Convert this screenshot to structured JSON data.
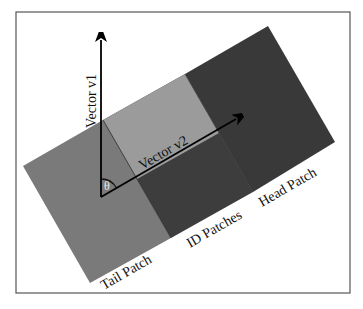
{
  "figure": {
    "frame": {
      "x": 16,
      "y": 12,
      "width": 334,
      "height": 281,
      "stroke": "#555555"
    },
    "colors": {
      "tail_patch": "#7a7a7a",
      "id_patch_light": "#9a9a9a",
      "id_patch_dark": "#3c3c3c",
      "head_patch": "#3a3a3a",
      "vectors": "#000000",
      "text": "#111111"
    },
    "patches": {
      "tail": {
        "label": "Tail Patch",
        "points": "23,166 103,120 171,238 90,283"
      },
      "id_dark": {
        "label": "ID Patches",
        "points": "103,120 185,74 253,192 171,238"
      },
      "id_light": {
        "points": "103,120 185,74 219,133 137,179"
      },
      "head": {
        "label": "Head Patch",
        "points": "185,74 268,26 335,142 253,192"
      }
    },
    "vectors": {
      "v1": {
        "label": "Vector v1",
        "x1": 101,
        "y1": 197,
        "x2": 101,
        "y2": 24
      },
      "v2": {
        "label": "Vector v2",
        "x1": 101,
        "y1": 197,
        "x2": 250,
        "y2": 111
      }
    },
    "angle": {
      "symbol": "θ",
      "cx": 101,
      "cy": 197,
      "r": 18
    },
    "labels": {
      "v1": "Vector v1",
      "v2": "Vector v2",
      "theta": "θ",
      "tail": "Tail Patch",
      "id": "ID Patches",
      "head": "Head Patch"
    }
  }
}
